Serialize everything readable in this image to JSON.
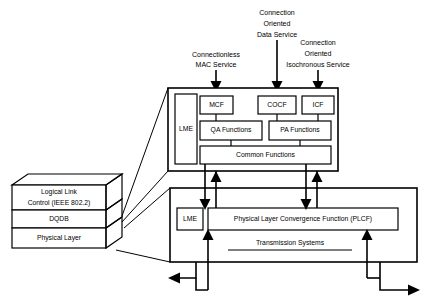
{
  "diagram": {
    "stack": {
      "name": "protocol-stack",
      "layers": [
        {
          "id": "llc",
          "line1": "Logical Link",
          "line2": "Control (IEEE 802.2)"
        },
        {
          "id": "dqdb",
          "line1": "DQDB",
          "line2": ""
        },
        {
          "id": "phy",
          "line1": "Physical Layer",
          "line2": ""
        }
      ]
    },
    "services": [
      {
        "id": "connectionless-mac",
        "lines": [
          "Connectionless",
          "MAC Service"
        ]
      },
      {
        "id": "connection-oriented-data",
        "lines": [
          "Connection",
          "Oriented",
          "Data Service"
        ]
      },
      {
        "id": "connection-oriented-isochronous",
        "lines": [
          "Connection",
          "Oriented",
          "Isochronous Service"
        ]
      }
    ],
    "dqdb_layer": {
      "lme": "LME",
      "convergence": [
        {
          "id": "mcf",
          "label": "MCF"
        },
        {
          "id": "cocf",
          "label": "COCF"
        },
        {
          "id": "icf",
          "label": "ICF"
        }
      ],
      "functions": [
        {
          "id": "qa",
          "label": "QA Functions"
        },
        {
          "id": "pa",
          "label": "PA Functions"
        }
      ],
      "common": "Common Functions"
    },
    "physical_layer": {
      "lme": "LME",
      "plcf": "Physical Layer Convergence Function (PLCF)",
      "transmission": "Transmission Systems"
    },
    "colors": {
      "line": "#000000",
      "fill": "#ffffff",
      "background": "#ffffff"
    }
  }
}
